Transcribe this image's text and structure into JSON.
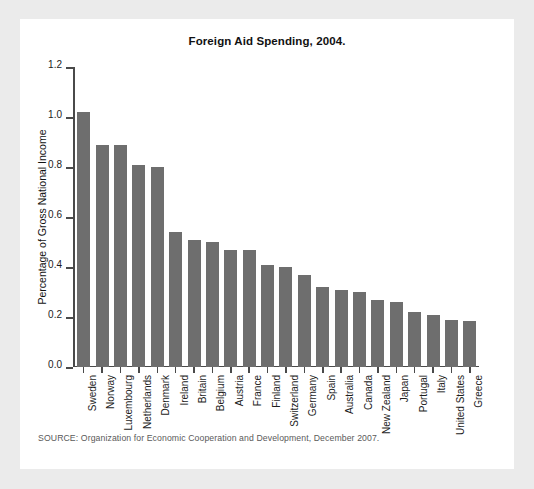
{
  "figure": {
    "title": "Foreign Aid Spending, 2004.",
    "source_note": "SOURCE: Organization for Economic Cooperation and Development, December 2007.",
    "bar_color": "#6e6e6e",
    "axis_color": "#4a4a4a",
    "card_background": "#ffffff",
    "page_background": "#ebebeb"
  },
  "chart_data": {
    "type": "bar",
    "title": "Foreign Aid Spending, 2004.",
    "xlabel": "",
    "ylabel": "Percentage of Gross National Income",
    "ylim": [
      0.0,
      1.2
    ],
    "yticks": [
      "0.0",
      "0.2",
      "0.4",
      "0.6",
      "0.8",
      "1.0",
      "1.2"
    ],
    "ytick_values": [
      0.0,
      0.2,
      0.4,
      0.6,
      0.8,
      1.0,
      1.2
    ],
    "grid": false,
    "legend": "none",
    "categories": [
      "Sweden",
      "Norway",
      "Luxembourg",
      "Netherlands",
      "Denmark",
      "Ireland",
      "Britain",
      "Belgium",
      "Austria",
      "France",
      "Finland",
      "Switzerland",
      "Germany",
      "Spain",
      "Australia",
      "Canada",
      "New Zealand",
      "Japan",
      "Portugal",
      "Italy",
      "United States",
      "Greece"
    ],
    "values": [
      1.02,
      0.89,
      0.89,
      0.81,
      0.8,
      0.54,
      0.51,
      0.5,
      0.47,
      0.47,
      0.41,
      0.4,
      0.37,
      0.32,
      0.31,
      0.3,
      0.27,
      0.26,
      0.22,
      0.21,
      0.19,
      0.185
    ]
  }
}
